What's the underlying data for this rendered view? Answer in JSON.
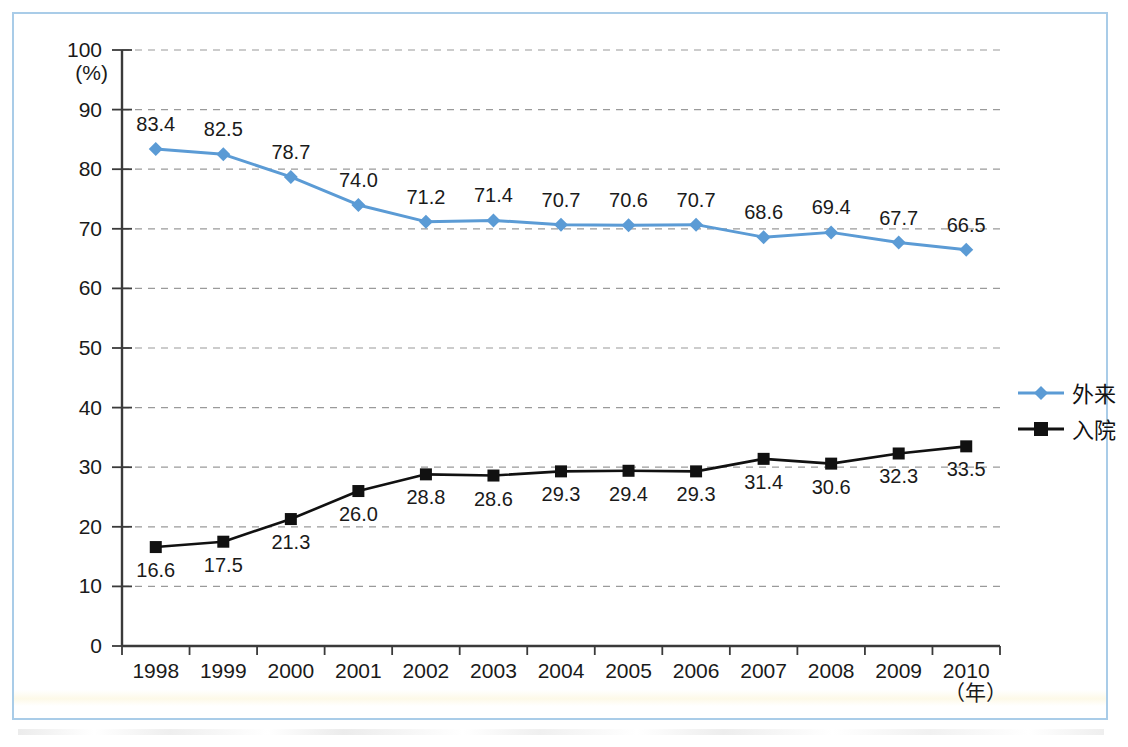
{
  "figure": {
    "frame_color": "#a9cce8",
    "background": "#ffffff"
  },
  "chart_data": {
    "type": "line",
    "title": "",
    "subtitle": "",
    "xlabel": "（年）",
    "ylabel": "",
    "y_unit_label": "(%)",
    "grid": true,
    "grid_style": "dashed-horizontal",
    "legend_position": "right-middle",
    "categories": [
      "1998",
      "1999",
      "2000",
      "2001",
      "2002",
      "2003",
      "2004",
      "2005",
      "2006",
      "2007",
      "2008",
      "2009",
      "2010"
    ],
    "x": [
      1998,
      1999,
      2000,
      2001,
      2002,
      2003,
      2004,
      2005,
      2006,
      2007,
      2008,
      2009,
      2010
    ],
    "ylim": [
      0,
      100
    ],
    "yticks": [
      0,
      10,
      20,
      30,
      40,
      50,
      60,
      70,
      80,
      90,
      100
    ],
    "ytick_labels": [
      "0",
      "10",
      "20",
      "30",
      "40",
      "50",
      "60",
      "70",
      "80",
      "90",
      "100"
    ],
    "series": [
      {
        "name": "外来",
        "color": "#5b9bd5",
        "marker": "diamond",
        "label_position": "above",
        "values": [
          83.4,
          82.5,
          78.7,
          74.0,
          71.2,
          71.4,
          70.7,
          70.6,
          70.7,
          68.6,
          69.4,
          67.7,
          66.5
        ],
        "value_labels": [
          "83.4",
          "82.5",
          "78.7",
          "74.0",
          "71.2",
          "71.4",
          "70.7",
          "70.6",
          "70.7",
          "68.6",
          "69.4",
          "67.7",
          "66.5"
        ]
      },
      {
        "name": "入院",
        "color": "#111111",
        "marker": "square",
        "label_position": "below",
        "values": [
          16.6,
          17.5,
          21.3,
          26.0,
          28.8,
          28.6,
          29.3,
          29.4,
          29.3,
          31.4,
          30.6,
          32.3,
          33.5
        ],
        "value_labels": [
          "16.6",
          "17.5",
          "21.3",
          "26.0",
          "28.8",
          "28.6",
          "29.3",
          "29.4",
          "29.3",
          "31.4",
          "30.6",
          "32.3",
          "33.5"
        ]
      }
    ],
    "legend": [
      {
        "label": "外来",
        "color": "#5b9bd5",
        "marker": "diamond"
      },
      {
        "label": "入院",
        "color": "#111111",
        "marker": "square"
      }
    ]
  }
}
